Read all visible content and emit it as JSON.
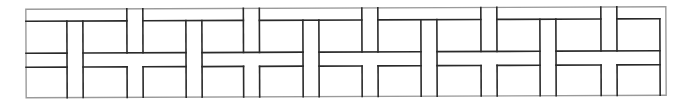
{
  "diagram": {
    "title": "Panel joinery pattern (T and cross strips)",
    "colors": {
      "frame": "#9a9a9a",
      "line": "#2a2a2a",
      "background": "#ffffff"
    },
    "outer_frame": {
      "left": 26,
      "right": 666,
      "top": 8,
      "bottom": 96.5
    },
    "inner_right": 660,
    "bands": {
      "top_line": 20,
      "mid_top": 52,
      "mid_bottom": 66,
      "bottom": 96.5
    },
    "strip_width": 16,
    "strips": [
      {
        "x": 67,
        "type": "stem"
      },
      {
        "x": 127,
        "type": "cross"
      },
      {
        "x": 186,
        "type": "stem"
      },
      {
        "x": 243.5,
        "type": "cross"
      },
      {
        "x": 303,
        "type": "stem"
      },
      {
        "x": 362,
        "type": "cross"
      },
      {
        "x": 421,
        "type": "stem"
      },
      {
        "x": 481,
        "type": "cross"
      },
      {
        "x": 540,
        "type": "stem"
      },
      {
        "x": 601,
        "type": "cross"
      }
    ],
    "tilt_deg": -0.23
  }
}
